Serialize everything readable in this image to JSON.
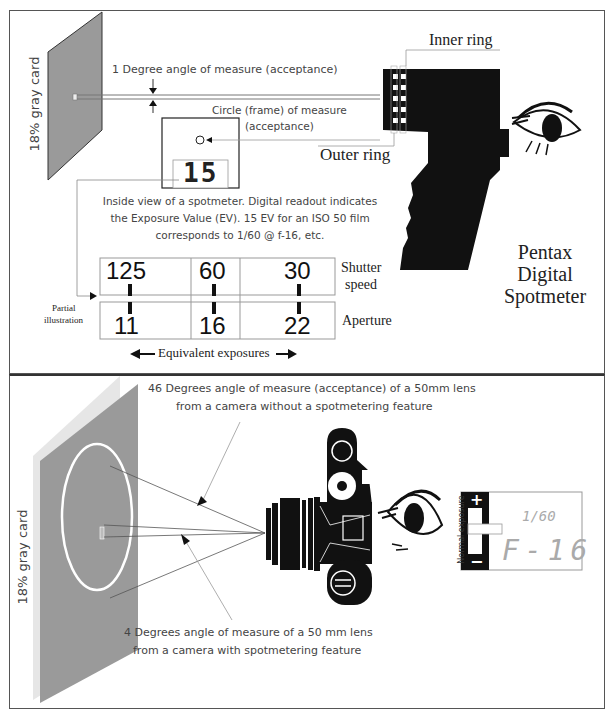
{
  "top_panel": {
    "gray_card_label": "18% gray card",
    "one_degree_label": "1 Degree angle of measure (acceptance)",
    "circle_label_line1": "Circle (frame) of measure",
    "circle_label_line2": "(acceptance)",
    "inner_ring_label": "Inner ring",
    "outer_ring_label": "Outer ring",
    "readout_value": "15",
    "description": [
      "Inside view of a spotmeter. Digital readout  indicates",
      "the Exposure Value (EV). 15 EV for an ISO 50 film",
      "corresponds to 1/60 @ f-16, etc."
    ],
    "device_title": [
      "Pentax",
      "Digital",
      "Spotmeter"
    ],
    "scale": {
      "shutter_values": [
        "125",
        "60",
        "30"
      ],
      "aperture_values": [
        "11",
        "16",
        "22"
      ],
      "shutter_label_line1": "Shutter",
      "shutter_label_line2": "speed",
      "aperture_label": "Aperture",
      "partial_label_line1": "Partial",
      "partial_label_line2": "illustration",
      "equivalent_label": "Equivalent exposures"
    }
  },
  "bottom_panel": {
    "gray_card_label": "18% gray card",
    "wide_label_line1": "46 Degrees angle of measure (acceptance) of a 50mm lens",
    "wide_label_line2": "from a camera without a spotmetering feature",
    "spot_label_line1": "4 Degrees angle of measure of a 50 mm lens",
    "spot_label_line2": "from a camera with spotmetering feature",
    "viewfinder": {
      "normal_exposure_label": "Normal exposure",
      "plus": "+",
      "minus": "−",
      "shutter_display": "1/60",
      "aperture_display": "F-16"
    }
  },
  "colors": {
    "gray_card": "#9a9a9a",
    "gray_card_edge": "#e6e6e6",
    "ink": "#111111",
    "line": "#888888"
  }
}
